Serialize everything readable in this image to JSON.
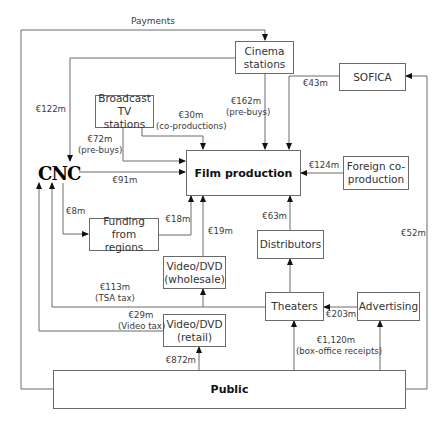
{
  "diagram": {
    "title_hint": "Financing flows of film production",
    "nodes": {
      "cinema_stations": "Cinema stations",
      "sofica": "SOFICA",
      "broadcast_tv": "Broadcast TV stations",
      "film_production": "Film production",
      "foreign_coproduction": "Foreign co-production",
      "cnc": "CNC",
      "funding_regions": "Funding from regions",
      "distributors": "Distributors",
      "video_wholesale": "Video/DVD (wholesale)",
      "theaters": "Theaters",
      "advertising": "Advertising",
      "video_retail": "Video/DVD (retail)",
      "public": "Public"
    },
    "node_lines": {
      "cinema_stations": [
        "Cinema",
        "stations"
      ],
      "broadcast_tv": [
        "Broadcast",
        "TV stations"
      ],
      "foreign_coproduction": [
        "Foreign co-",
        "production"
      ],
      "funding_regions": [
        "Funding from",
        "regions"
      ],
      "video_wholesale": [
        "Video/DVD",
        "(wholesale)"
      ],
      "video_retail": [
        "Video/DVD",
        "(retail)"
      ]
    },
    "labels": {
      "payments": "Payments",
      "cnc_122": "€122m",
      "broadcast_30": "€30m",
      "broadcast_30_note": "(co-productions)",
      "cinema_162": "€162m",
      "cinema_162_note": "(pre-buys)",
      "sofica_43": "€43m",
      "broadcast_72": "€72m",
      "broadcast_72_note": "(pre-buys)",
      "cnc_91": "€91m",
      "foreign_124": "€124m",
      "cnc_8": "€8m",
      "regions_18": "€18m",
      "wholesale_19": "€19m",
      "distributors_63": "€63m",
      "public_52": "€52m",
      "tsa_113": "€113m",
      "tsa_note": "(TSA tax)",
      "advertising_203": "€203m",
      "video_tax_29": "€29m",
      "video_tax_note": "(Video tax)",
      "boxoffice_1120": "€1,120m",
      "boxoffice_note": "(box-office receipts)",
      "retail_872": "€872m"
    },
    "flows": [
      {
        "from": "Public",
        "to": "Cinema stations",
        "label": "Payments"
      },
      {
        "from": "Cinema stations",
        "to": "CNC",
        "value": "€122m"
      },
      {
        "from": "Broadcast TV stations",
        "to": "Film production",
        "value": "€30m",
        "note": "(co-productions)"
      },
      {
        "from": "Cinema stations",
        "to": "Film production",
        "value": "€162m",
        "note": "(pre-buys)"
      },
      {
        "from": "SOFICA",
        "to": "Film production",
        "value": "€43m"
      },
      {
        "from": "Broadcast TV stations",
        "to": "Film production",
        "value": "€72m",
        "note": "(pre-buys)"
      },
      {
        "from": "CNC",
        "to": "Film production",
        "value": "€91m"
      },
      {
        "from": "Foreign co-production",
        "to": "Film production",
        "value": "€124m"
      },
      {
        "from": "CNC",
        "to": "Funding from regions",
        "value": "€8m"
      },
      {
        "from": "Funding from regions",
        "to": "Film production",
        "value": "€18m"
      },
      {
        "from": "Video/DVD (wholesale)",
        "to": "Film production",
        "value": "€19m"
      },
      {
        "from": "Distributors",
        "to": "Film production",
        "value": "€63m"
      },
      {
        "from": "Public",
        "to": "SOFICA",
        "value": "€52m"
      },
      {
        "from": "Theaters",
        "to": "CNC",
        "value": "€113m",
        "note": "(TSA tax)"
      },
      {
        "from": "Advertising",
        "to": "Theaters",
        "value": "€203m"
      },
      {
        "from": "Video/DVD (retail)",
        "to": "CNC",
        "value": "€29m",
        "note": "(Video tax)"
      },
      {
        "from": "Public",
        "to": "Theaters",
        "value": "€1,120m",
        "note": "(box-office receipts)"
      },
      {
        "from": "Public",
        "to": "Video/DVD (retail)",
        "value": "€872m"
      }
    ]
  }
}
